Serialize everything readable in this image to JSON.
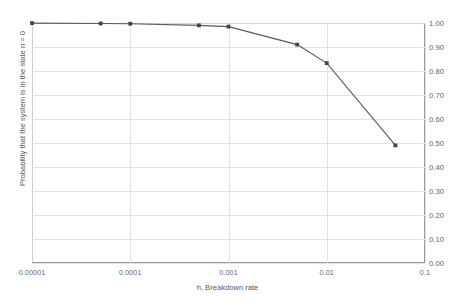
{
  "chart_data": {
    "type": "line",
    "title": "",
    "xlabel": "h, Breakdown rate",
    "ylabel": "Probability that the system is in the state n = 0",
    "xscale": "log",
    "xlim": [
      1e-05,
      0.1
    ],
    "ylim": [
      0.0,
      1.0
    ],
    "grid": true,
    "legend": false,
    "y_axis_position": "right",
    "x": [
      1e-05,
      5e-05,
      0.0001,
      0.0005,
      0.001,
      0.005,
      0.01,
      0.05
    ],
    "values": [
      0.9995,
      0.998,
      0.997,
      0.99,
      0.985,
      0.91,
      0.833,
      0.49
    ],
    "xticks": [
      "0.00001",
      "0.0001",
      "0.001",
      "0.01",
      "0.1"
    ],
    "xtick_values": [
      1e-05,
      0.0001,
      0.001,
      0.01,
      0.1
    ],
    "yticks": [
      "0.00",
      "0.10",
      "0.20",
      "0.30",
      "0.40",
      "0.50",
      "0.60",
      "0.70",
      "0.80",
      "0.90",
      "1.00"
    ],
    "ytick_values": [
      0.0,
      0.1,
      0.2,
      0.3,
      0.4,
      0.5,
      0.6,
      0.7,
      0.8,
      0.9,
      1.0
    ],
    "series_color": "#595959",
    "marker_color": "#444444",
    "grid_color": "#e3e3e3",
    "axis_color": "#9a9a9a",
    "text_color": "#636363"
  }
}
